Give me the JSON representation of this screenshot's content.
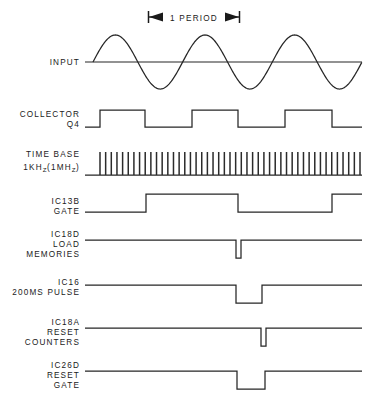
{
  "figure": {
    "background_color": "#ffffff",
    "trace_color": "#262626",
    "text_color": "#1a1a1a",
    "width": 375,
    "height": 399
  },
  "annotation": {
    "period_label": "1 PERIOD",
    "span_start_x": 148,
    "span_end_x": 240,
    "y": 17
  },
  "rows": [
    {
      "id": "input",
      "label_lines": [
        "INPUT"
      ],
      "label_x": 80,
      "label_baseline_y": 65,
      "type": "sine",
      "baseline_y": 62,
      "amplitude": 27,
      "x_start": 85,
      "x_end": 362,
      "cycles": 3,
      "phase_start_x": 93
    },
    {
      "id": "collector-q4",
      "label_lines": [
        "COLLECTOR",
        "Q4"
      ],
      "label_x": 80,
      "label_baseline_y": 117,
      "type": "square",
      "low_y": 127,
      "high_y": 110,
      "x_start": 85,
      "x_end": 362,
      "edges": [
        100,
        145,
        192,
        238,
        285,
        332
      ],
      "start_level": "low"
    },
    {
      "id": "time-base",
      "label_lines": [
        "TIME BASE",
        "1KHZ(1MHZ)"
      ],
      "label_x": 80,
      "label_baseline_y": 161,
      "type": "pulse-train",
      "low_y": 175,
      "high_y": 152,
      "x_start": 85,
      "x_end": 362,
      "pulse_start_x": 100,
      "pulse_end_x": 360,
      "pulse_count": 47
    },
    {
      "id": "ic13b-gate",
      "label_lines": [
        "IC13B",
        "GATE"
      ],
      "label_x": 80,
      "label_baseline_y": 204,
      "type": "square",
      "low_y": 212,
      "high_y": 194,
      "x_start": 85,
      "x_end": 362,
      "edges": [
        146,
        238,
        332
      ],
      "start_level": "low"
    },
    {
      "id": "ic18d-load-memories",
      "label_lines": [
        "IC18D",
        "LOAD",
        "MEMORIES"
      ],
      "label_x": 80,
      "label_baseline_y": 241,
      "type": "neg-pulse",
      "high_y": 240,
      "low_y": 258,
      "x_start": 85,
      "x_end": 362,
      "pulses": [
        [
          236,
          241
        ]
      ]
    },
    {
      "id": "ic16-200ms-pulse",
      "label_lines": [
        "IC16",
        "200MS PULSE"
      ],
      "label_x": 80,
      "label_baseline_y": 288,
      "type": "neg-pulse",
      "high_y": 285,
      "low_y": 303,
      "x_start": 85,
      "x_end": 362,
      "pulses": [
        [
          236,
          262
        ]
      ]
    },
    {
      "id": "ic18a-reset-counters",
      "label_lines": [
        "IC18A",
        "RESET",
        "COUNTERS"
      ],
      "label_x": 80,
      "label_baseline_y": 330,
      "type": "neg-pulse",
      "high_y": 328,
      "low_y": 346,
      "x_start": 85,
      "x_end": 362,
      "pulses": [
        [
          261,
          266
        ]
      ]
    },
    {
      "id": "ic26d-reset-gate",
      "label_lines": [
        "IC26D",
        "RESET",
        "GATE"
      ],
      "label_x": 80,
      "label_baseline_y": 373,
      "type": "neg-pulse",
      "high_y": 371,
      "low_y": 389,
      "x_start": 85,
      "x_end": 362,
      "pulses": [
        [
          237,
          265
        ]
      ]
    }
  ],
  "label_text": {
    "input": "INPUT",
    "collector": "COLLECTOR",
    "q4": "Q4",
    "time_base": "TIME BASE",
    "freq_prefix": "1KH",
    "freq_sub1": "Z",
    "freq_mid": "(1MH",
    "freq_sub2": "Z",
    "freq_suffix": ")",
    "ic13b": "IC13B",
    "gate": "GATE",
    "ic18d": "IC18D",
    "load": "LOAD",
    "memories": "MEMORIES",
    "ic16": "IC16",
    "pulse_200ms": "200MS PULSE",
    "ic18a": "IC18A",
    "reset": "RESET",
    "counters": "COUNTERS",
    "ic26d": "IC26D",
    "reset2": "RESET",
    "gate2": "GATE",
    "period": "1 PERIOD"
  }
}
